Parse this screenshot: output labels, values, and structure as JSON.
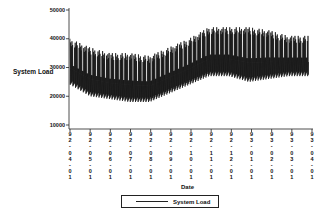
{
  "chart_data": {
    "type": "line",
    "title": "",
    "xlabel": "Date",
    "ylabel": "System Load",
    "ylim": [
      10000,
      50000
    ],
    "yticks": [
      10000,
      20000,
      30000,
      40000,
      50000
    ],
    "xticks": [
      "92-04-01",
      "92-05-01",
      "92-06-01",
      "92-07-01",
      "92-08-01",
      "92-09-01",
      "92-10-01",
      "92-11-01",
      "92-12-01",
      "93-01-01",
      "93-02-01",
      "93-03-01",
      "93-04-01"
    ],
    "legend": {
      "position": "bottom",
      "entries": [
        "System Load"
      ]
    },
    "grid": false,
    "series": [
      {
        "name": "System Load",
        "note": "daily oscillating load; approximate monthly envelopes (min, max)",
        "x": [
          "92-04",
          "92-05",
          "92-06",
          "92-07",
          "92-08",
          "92-09",
          "92-10",
          "92-11",
          "92-12",
          "93-01",
          "93-02",
          "93-03"
        ],
        "min": [
          24000,
          20000,
          19000,
          18000,
          18000,
          21000,
          24000,
          27000,
          27000,
          25000,
          26000,
          27000
        ],
        "max": [
          40000,
          37000,
          35000,
          35000,
          34000,
          37000,
          40000,
          44000,
          44000,
          44000,
          43000,
          41000
        ]
      }
    ]
  },
  "labels": {
    "ylabel": "System Load",
    "xlabel": "Date",
    "legend": "System Load",
    "yticks": [
      "50000",
      "40000",
      "30000",
      "20000",
      "10000"
    ],
    "xticks": [
      "9\n2\n-\n0\n4\n-\n0\n1",
      "9\n2\n-\n0\n5\n-\n0\n1",
      "9\n2\n-\n0\n6\n-\n0\n1",
      "9\n2\n-\n0\n7\n-\n0\n1",
      "9\n2\n-\n0\n8\n-\n0\n1",
      "9\n2\n-\n0\n9\n-\n0\n1",
      "9\n2\n-\n1\n0\n-\n0\n1",
      "9\n2\n-\n1\n1\n-\n0\n1",
      "9\n2\n-\n1\n2\n-\n0\n1",
      "9\n3\n-\n0\n1\n-\n0\n1",
      "9\n3\n-\n0\n2\n-\n0\n1",
      "9\n3\n-\n0\n3\n-\n0\n1",
      "9\n3\n-\n0\n4\n-\n0\n1"
    ]
  }
}
